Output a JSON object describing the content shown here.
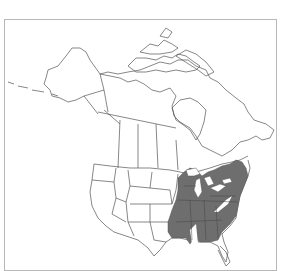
{
  "map": {
    "type": "species-range-map",
    "region": "North America",
    "colors": {
      "background": "#ffffff",
      "frame": "#b8b8b8",
      "outline": "#555555",
      "range_fill": "#6e6e6e"
    },
    "shaded_range": "Eastern United States (east of the Great Plains, south of the Great Lakes to the Gulf Coast, New England excluding northern Maine, Florida peninsula excluded)",
    "labels": []
  }
}
